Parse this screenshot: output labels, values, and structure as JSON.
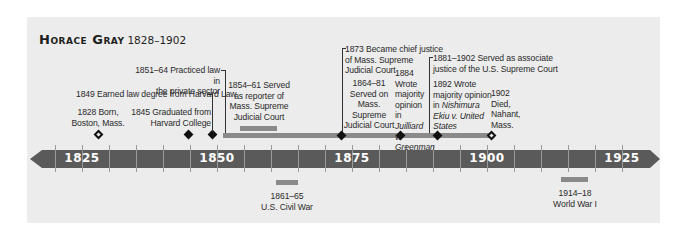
{
  "title": {
    "name": "Horace Gray",
    "years": "1828–1902"
  },
  "axis": {
    "start_year": 1820,
    "end_year": 1930,
    "labels": [
      {
        "year": 1825,
        "text": "1825",
        "x": 82
      },
      {
        "year": 1850,
        "text": "1850",
        "x": 217
      },
      {
        "year": 1875,
        "text": "1875",
        "x": 352
      },
      {
        "year": 1900,
        "text": "1900",
        "x": 487
      },
      {
        "year": 1925,
        "text": "1925",
        "x": 622
      }
    ],
    "bar_color": "#5a5a5a",
    "label_color": "#ffffff"
  },
  "events": {
    "born": {
      "line1": "1828 Born,",
      "line2": "Boston, Mass."
    },
    "harvard_college": {
      "line1": "1845 Graduated from",
      "line2": "Harvard College"
    },
    "harvard_law": {
      "text": "1849 Earned law degree from Harvard Law"
    },
    "private_practice": {
      "line1": "1851–64 Practiced law in",
      "line2": "the private sector"
    },
    "reporter": {
      "line1": "1854–61 Served",
      "line2": "as reporter of",
      "line3": "Mass. Supreme",
      "line4": "Judicial Court"
    },
    "chief_justice": {
      "line1": "1873 Became chief justice",
      "line2": "of Mass. Supreme",
      "line3": "Judicial Court"
    },
    "mass_sjc": {
      "line1": "1864–81",
      "line2": "Served on",
      "line3": "Mass.",
      "line4": "Supreme",
      "line5": "Judicial Court"
    },
    "juilliard": {
      "line1": "1884",
      "line2": "Wrote",
      "line3": "majority",
      "line4": "opinion in",
      "line5": "Juilliard v.",
      "line6": "Greenman"
    },
    "associate_justice": {
      "line1": "1881–1902 Served as associate",
      "line2": "justice of the U.S. Supreme Court"
    },
    "nishimura": {
      "line1": "1892 Wrote",
      "line2": "majority opinion",
      "line3_prefix": "in ",
      "line3_italic": "Nishimura",
      "line4": "Ekiu v. United",
      "line5": "States"
    },
    "died": {
      "line1": "1902",
      "line2": "Died,",
      "line3": "Nahant,",
      "line4": "Mass."
    }
  },
  "context_events": {
    "civil_war": {
      "line1": "1861–65",
      "line2": "U.S. Civil War"
    },
    "wwi": {
      "line1": "1914–18",
      "line2": "World War I"
    }
  },
  "colors": {
    "panel": "#ececec",
    "timeline_arrow": "#5a5a5a",
    "span_bar": "#8a8a8a",
    "marker": "#111111",
    "text": "#2a2a2a"
  }
}
